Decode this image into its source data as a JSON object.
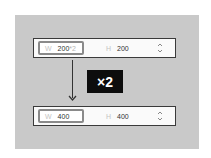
{
  "before": {
    "width_label": "W",
    "width_value": "200",
    "width_suffix": "*2",
    "height_label": "H",
    "height_value": "200",
    "stepper_icon": "up-down-chevron-icon"
  },
  "multiplier": {
    "label": "×2"
  },
  "after": {
    "width_label": "W",
    "width_value": "400",
    "height_label": "H",
    "height_value": "400",
    "stepper_icon": "up-down-chevron-icon"
  },
  "colors": {
    "panel": "#c9c9c9",
    "badge": "#0d0d0d",
    "field_border": "#8a8a8a"
  }
}
